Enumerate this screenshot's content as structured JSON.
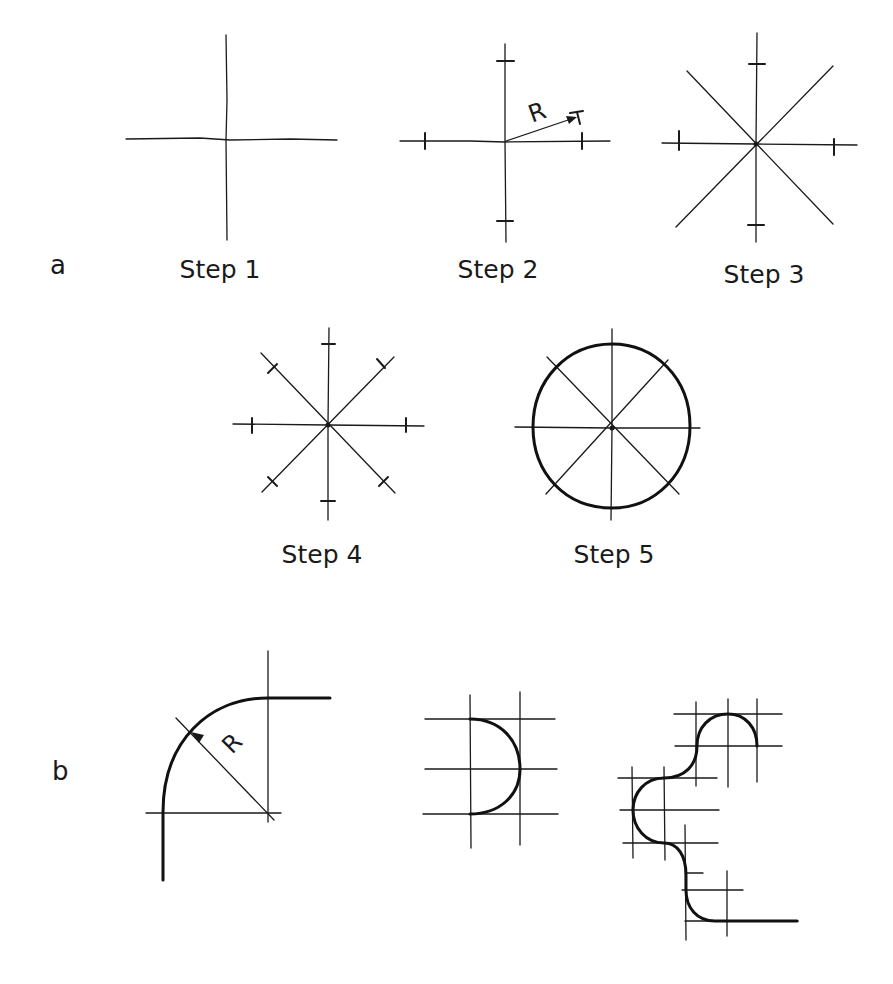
{
  "parts": {
    "a": {
      "label": "a"
    },
    "b": {
      "label": "b"
    }
  },
  "steps": [
    {
      "label": "Step 1"
    },
    {
      "label": "Step 2"
    },
    {
      "label": "Step 3"
    },
    {
      "label": "Step 4"
    },
    {
      "label": "Step 5"
    }
  ],
  "annotations": {
    "radius_step2": "R",
    "radius_b": "R"
  },
  "colors": {
    "ink": "#1a1a1a",
    "background": "#ffffff"
  }
}
